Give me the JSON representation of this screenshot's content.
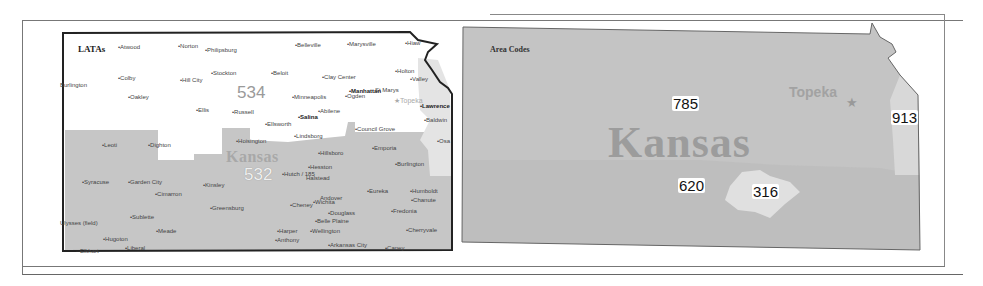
{
  "figure": {
    "left_map": {
      "title": "LATAs",
      "state_label": "Kansas",
      "lata_labels": [
        "534",
        "532"
      ],
      "capital": "Topeka",
      "cities": [
        {
          "name": "Atwood",
          "x": 118,
          "y": 44
        },
        {
          "name": "Norton",
          "x": 178,
          "y": 43
        },
        {
          "name": "Philipsburg",
          "x": 205,
          "y": 47
        },
        {
          "name": "Belleville",
          "x": 295,
          "y": 42
        },
        {
          "name": "Marysville",
          "x": 347,
          "y": 41
        },
        {
          "name": "Hiaw",
          "x": 405,
          "y": 40
        },
        {
          "name": "Burlington",
          "x": 60,
          "y": 82,
          "nodot": true
        },
        {
          "name": "Colby",
          "x": 118,
          "y": 75
        },
        {
          "name": "Hill City",
          "x": 180,
          "y": 77
        },
        {
          "name": "Stockton",
          "x": 211,
          "y": 70
        },
        {
          "name": "Beloit",
          "x": 271,
          "y": 70
        },
        {
          "name": "Clay Center",
          "x": 322,
          "y": 74
        },
        {
          "name": "Holton",
          "x": 395,
          "y": 68
        },
        {
          "name": "Valley",
          "x": 410,
          "y": 76
        },
        {
          "name": "Oakley",
          "x": 128,
          "y": 94
        },
        {
          "name": "Minneapolis",
          "x": 292,
          "y": 94
        },
        {
          "name": "Manhattan",
          "x": 349,
          "y": 88,
          "bold": true
        },
        {
          "name": "St Marys",
          "x": 375,
          "y": 87,
          "nodot": true
        },
        {
          "name": "Ogden",
          "x": 345,
          "y": 93
        },
        {
          "name": "Lawrence",
          "x": 420,
          "y": 103,
          "bold": true
        },
        {
          "name": "Ellis",
          "x": 196,
          "y": 107
        },
        {
          "name": "Russell",
          "x": 232,
          "y": 109
        },
        {
          "name": "Abilene",
          "x": 318,
          "y": 108
        },
        {
          "name": "Salina",
          "x": 298,
          "y": 114,
          "bold": true
        },
        {
          "name": "Baldwin",
          "x": 424,
          "y": 117
        },
        {
          "name": "Ellsworth",
          "x": 265,
          "y": 121
        },
        {
          "name": "Council Grove",
          "x": 355,
          "y": 126
        },
        {
          "name": "Lindsborg",
          "x": 294,
          "y": 133
        },
        {
          "name": "Hoisington",
          "x": 236,
          "y": 138
        },
        {
          "name": "Osa",
          "x": 437,
          "y": 138
        },
        {
          "name": "Leoti",
          "x": 102,
          "y": 142
        },
        {
          "name": "Dighton",
          "x": 148,
          "y": 142
        },
        {
          "name": "Emporia",
          "x": 372,
          "y": 145
        },
        {
          "name": "Hillsboro",
          "x": 318,
          "y": 150
        },
        {
          "name": "Burlington",
          "x": 395,
          "y": 161
        },
        {
          "name": "Hesston",
          "x": 308,
          "y": 164
        },
        {
          "name": "Hutch / 185",
          "x": 282,
          "y": 171
        },
        {
          "name": "Halstead",
          "x": 306,
          "y": 175,
          "nodot": true
        },
        {
          "name": "Syracuse",
          "x": 82,
          "y": 179
        },
        {
          "name": "Garden City",
          "x": 128,
          "y": 179
        },
        {
          "name": "Kinsley",
          "x": 203,
          "y": 182
        },
        {
          "name": "Cimarron",
          "x": 155,
          "y": 191
        },
        {
          "name": "Eureka",
          "x": 367,
          "y": 188
        },
        {
          "name": "Humboldt",
          "x": 410,
          "y": 188
        },
        {
          "name": "Chanute",
          "x": 411,
          "y": 197
        },
        {
          "name": "Andover",
          "x": 320,
          "y": 195,
          "nodot": true
        },
        {
          "name": "Wichita",
          "x": 313,
          "y": 199
        },
        {
          "name": "Cheney",
          "x": 290,
          "y": 202
        },
        {
          "name": "Greensburg",
          "x": 210,
          "y": 205
        },
        {
          "name": "Douglass",
          "x": 328,
          "y": 210
        },
        {
          "name": "Fredonia",
          "x": 391,
          "y": 208
        },
        {
          "name": "Belle Plaine",
          "x": 315,
          "y": 218
        },
        {
          "name": "Sublette",
          "x": 130,
          "y": 214
        },
        {
          "name": "Ulysses (field)",
          "x": 60,
          "y": 220,
          "nodot": true
        },
        {
          "name": "Harper",
          "x": 277,
          "y": 228
        },
        {
          "name": "Wellington",
          "x": 310,
          "y": 228
        },
        {
          "name": "Cherryvale",
          "x": 406,
          "y": 227
        },
        {
          "name": "Meade",
          "x": 156,
          "y": 228
        },
        {
          "name": "Hugoton",
          "x": 103,
          "y": 236
        },
        {
          "name": "Anthony",
          "x": 275,
          "y": 237
        },
        {
          "name": "Arkansas City",
          "x": 328,
          "y": 242
        },
        {
          "name": "Caney",
          "x": 385,
          "y": 245
        },
        {
          "name": "Elkhart",
          "x": 80,
          "y": 248,
          "nodot": true
        },
        {
          "name": "Liberal",
          "x": 125,
          "y": 245
        }
      ]
    },
    "right_map": {
      "title": "Area Codes",
      "state_label": "Kansas",
      "capital": "Topeka",
      "area_codes": [
        {
          "code": "785",
          "x": 672,
          "y": 96
        },
        {
          "code": "913",
          "x": 891,
          "y": 110
        },
        {
          "code": "620",
          "x": 678,
          "y": 178
        },
        {
          "code": "316",
          "x": 752,
          "y": 184
        }
      ]
    },
    "colors": {
      "region_534": "#ffffff",
      "region_532": "#c6c6c6",
      "region_785": "#c4c4c4",
      "region_620": "#bdbdbd",
      "region_316": "#dedede",
      "region_913": "#d6d6d6",
      "border": "#222222"
    }
  }
}
